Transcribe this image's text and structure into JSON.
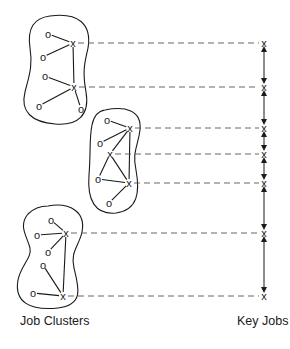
{
  "labels": {
    "left": "Job Clusters",
    "right": "Key Jobs"
  },
  "glyphs": {
    "key_job": "x",
    "job": "o"
  },
  "colors": {
    "ink": "#1a1a1a",
    "dash": "#555555",
    "background": "#ffffff"
  },
  "clusters": [
    {
      "id": "cluster-1",
      "key_jobs": [
        {
          "x": 73,
          "y": 43
        },
        {
          "x": 74,
          "y": 87
        }
      ],
      "jobs": [
        {
          "x": 48,
          "y": 34
        },
        {
          "x": 43,
          "y": 57
        },
        {
          "x": 45,
          "y": 76
        },
        {
          "x": 39,
          "y": 106
        },
        {
          "x": 81,
          "y": 109
        }
      ]
    },
    {
      "id": "cluster-2",
      "key_jobs": [
        {
          "x": 130,
          "y": 128
        },
        {
          "x": 110,
          "y": 154
        },
        {
          "x": 129,
          "y": 183
        }
      ],
      "jobs": [
        {
          "x": 107,
          "y": 120
        },
        {
          "x": 100,
          "y": 143
        },
        {
          "x": 98,
          "y": 179
        },
        {
          "x": 109,
          "y": 203
        }
      ]
    },
    {
      "id": "cluster-3",
      "key_jobs": [
        {
          "x": 66,
          "y": 233
        },
        {
          "x": 63,
          "y": 296
        }
      ],
      "jobs": [
        {
          "x": 51,
          "y": 220
        },
        {
          "x": 37,
          "y": 235
        },
        {
          "x": 48,
          "y": 252
        },
        {
          "x": 43,
          "y": 265
        },
        {
          "x": 33,
          "y": 293
        }
      ]
    }
  ],
  "key_job_scale": {
    "x": 264,
    "positions": [
      43,
      87,
      128,
      154,
      183,
      233,
      296
    ]
  }
}
